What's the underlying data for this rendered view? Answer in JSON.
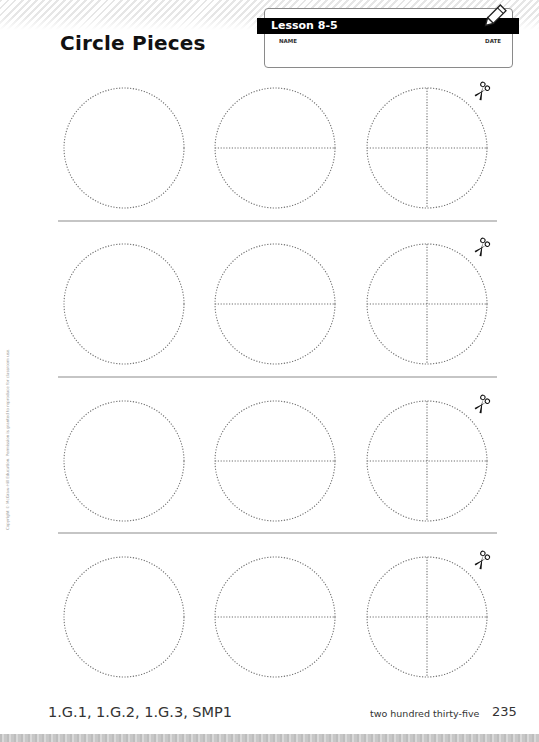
{
  "header": {
    "title": "Circle Pieces",
    "lesson": "Lesson 8-5",
    "name_label": "NAME",
    "date_label": "DATE",
    "icon": "pencil-icon"
  },
  "sheet": {
    "columns_cx": [
      124,
      275,
      427
    ],
    "rows_cy": [
      148,
      304,
      461,
      617
    ],
    "radius": 60,
    "dividers_y": [
      221,
      377,
      533
    ],
    "column_types": [
      "whole",
      "halves",
      "fourths"
    ],
    "cut_icon": "scissors-icon",
    "stroke_color": "#6e6e6e"
  },
  "side_note": "Copyright © McGraw-Hill Education. Permission is granted to reproduce for classroom use.",
  "footer": {
    "standards": "1.G.1, 1.G.2, 1.G.3, SMP1",
    "page_words": "two hundred thirty-five",
    "page_number": "235"
  }
}
